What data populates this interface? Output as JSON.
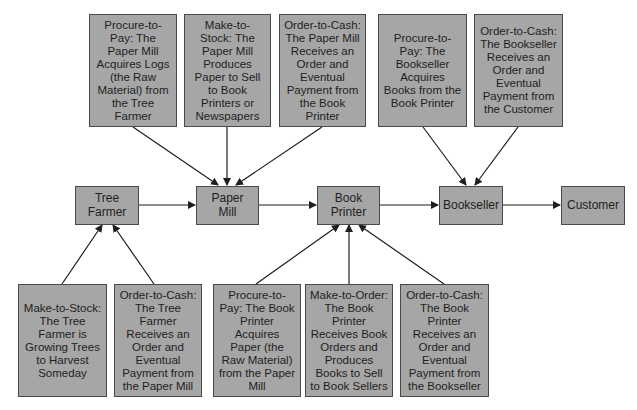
{
  "diagram": {
    "nodes": [
      {
        "id": "tree-farmer",
        "label": "Tree\nFarmer"
      },
      {
        "id": "paper-mill",
        "label": "Paper\nMill"
      },
      {
        "id": "book-printer",
        "label": "Book\nPrinter"
      },
      {
        "id": "bookseller",
        "label": "Bookseller"
      },
      {
        "id": "customer",
        "label": "Customer"
      }
    ],
    "top_notes": [
      {
        "text": "Procure-to-Pay: The Paper Mill Acquires Logs (the Raw Material) from the Tree Farmer",
        "target": "paper-mill"
      },
      {
        "text": "Make-to-Stock: The Paper Mill Produces Paper to Sell to Book Printers or Newspapers",
        "target": "paper-mill"
      },
      {
        "text": "Order-to-Cash: The Paper Mill Receives an Order and Eventual Payment from the Book Printer",
        "target": "paper-mill"
      },
      {
        "text": "Procure-to-Pay: The Bookseller Acquires Books from the Book Printer",
        "target": "bookseller"
      },
      {
        "text": "Order-to-Cash: The Bookseller Receives an Order and Eventual Payment from the Customer",
        "target": "bookseller"
      }
    ],
    "bottom_notes": [
      {
        "text": "Make-to-Stock: The Tree Farmer is Growing Trees to Harvest Someday",
        "target": "tree-farmer"
      },
      {
        "text": "Order-to-Cash: The Tree Farmer Receives an Order and Eventual Payment from the Paper Mill",
        "target": "tree-farmer"
      },
      {
        "text": "Procure-to-Pay: The Book Printer Acquires Paper (the Raw Material) from the Paper Mill",
        "target": "book-printer"
      },
      {
        "text": "Make-to-Order: The Book Printer Receives Book Orders and Produces Books to Sell to Book Sellers",
        "target": "book-printer"
      },
      {
        "text": "Order-to-Cash: The Book Printer Receives an Order and Eventual Payment from the Bookseller",
        "target": "book-printer"
      }
    ],
    "flow_edges": [
      {
        "from": "tree-farmer",
        "to": "paper-mill"
      },
      {
        "from": "paper-mill",
        "to": "book-printer"
      },
      {
        "from": "book-printer",
        "to": "bookseller"
      },
      {
        "from": "bookseller",
        "to": "customer"
      }
    ],
    "colors": {
      "box_fill": "#a6a6a6",
      "box_border": "#4a4a4a",
      "line": "#1e1e1e",
      "background": "#ffffff"
    }
  }
}
